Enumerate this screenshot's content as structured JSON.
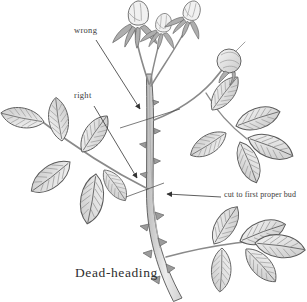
{
  "figure": {
    "caption": "Dead-heading",
    "labels": {
      "wrong": "wrong",
      "right": "right",
      "cut_instruction": "cut to first proper bud"
    },
    "colors": {
      "background": "#ffffff",
      "text_ink": "#3a3a3a",
      "annotation_line": "#333333",
      "stem_fill": "#d6d6d6",
      "leaf_light": "#f6f6f6",
      "leaf_dark": "#c9c9c9"
    },
    "icons": {
      "arrow_wrong": "arrow-icon",
      "arrow_right": "arrow-icon",
      "arrow_cut": "arrow-icon"
    }
  }
}
